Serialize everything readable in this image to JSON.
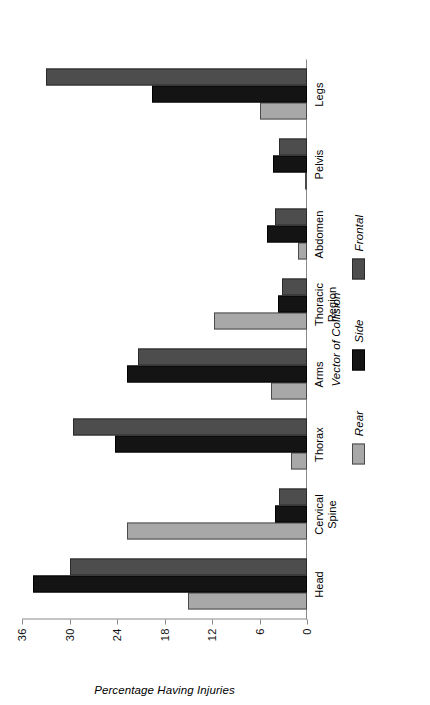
{
  "chart_data": {
    "type": "bar",
    "orientation": "vertical-grouped",
    "title": "",
    "xlabel": "",
    "ylabel": "Percentage Having Injuries",
    "ylim": [
      0,
      36
    ],
    "yticks": [
      0,
      6,
      12,
      18,
      24,
      30,
      36
    ],
    "grid": false,
    "legend_title": "Vector of Collision",
    "legend_position": "bottom",
    "categories": [
      "Head",
      "Cervical\nSpine",
      "Thorax",
      "Arms",
      "Thoracic\nRegion",
      "Abdomen",
      "Pelvis",
      "Legs"
    ],
    "series": [
      {
        "name": "Rear",
        "color": "#a8a8a8",
        "values": [
          15.0,
          22.7,
          2.0,
          4.6,
          11.8,
          1.2,
          0.3,
          5.9
        ]
      },
      {
        "name": "Side",
        "color": "#141414",
        "values": [
          34.6,
          4.1,
          24.3,
          22.7,
          3.7,
          5.1,
          4.3,
          19.6
        ]
      },
      {
        "name": "Frontal",
        "color": "#4d4d4d",
        "values": [
          29.9,
          3.6,
          29.6,
          21.3,
          3.1,
          4.1,
          3.6,
          33.0
        ]
      }
    ]
  }
}
